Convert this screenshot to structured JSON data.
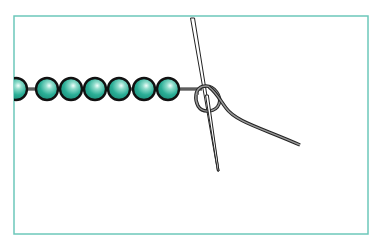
{
  "figure": {
    "colors": {
      "frame_border": "#6cc8ba",
      "bead_fill": "#2aae96",
      "bead_highlight": "#e8fbf7",
      "bead_outline": "#111111",
      "thread": "#888888",
      "thread_outline": "#222222",
      "needle": "#ffffff",
      "needle_outline": "#222222"
    },
    "bead_count_visible": 7,
    "beads": [
      {
        "cx": 16,
        "cy": 89,
        "r": 11
      },
      {
        "cx": 47,
        "cy": 89,
        "r": 11
      },
      {
        "cx": 71,
        "cy": 89,
        "r": 11
      },
      {
        "cx": 95,
        "cy": 89,
        "r": 11
      },
      {
        "cx": 119,
        "cy": 89,
        "r": 11
      },
      {
        "cx": 144,
        "cy": 89,
        "r": 11
      },
      {
        "cx": 168,
        "cy": 89,
        "r": 11
      }
    ],
    "elements": [
      "bead-strand",
      "thread",
      "knot-loop",
      "needle",
      "thread-tail"
    ]
  }
}
